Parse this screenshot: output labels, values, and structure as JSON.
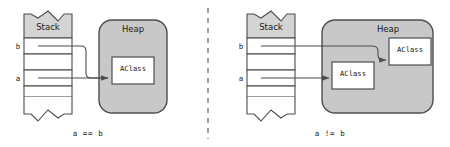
{
  "figure": {
    "type": "diagram",
    "background_color": "#ffffff",
    "stroke_color": "#4d4d4d",
    "text_color": "#1a1a1a",
    "stack_header_fill": "#d4d4d4",
    "stack_cell_fill": "#ffffff",
    "heap_fill": "#c8c8c8",
    "object_fill": "#ffffff",
    "divider": {
      "name": "panel-divider",
      "style": "dashed",
      "orientation": "vertical",
      "x": 208
    }
  },
  "panels": [
    {
      "id": "left",
      "caption": "a == b",
      "stack": {
        "title": "Stack",
        "torn_edges": true,
        "variables": [
          {
            "name": "b",
            "label": "b",
            "has_reference": true
          },
          {
            "name": "a",
            "label": "a",
            "has_reference": true
          }
        ],
        "cell_count": 5
      },
      "heap": {
        "title": "Heap",
        "objects": [
          {
            "label": "AClass",
            "id": "obj1"
          }
        ]
      },
      "references": [
        {
          "from": "b",
          "to": "obj1"
        },
        {
          "from": "a",
          "to": "obj1"
        }
      ],
      "meaning": "both variables reference the same object"
    },
    {
      "id": "right",
      "caption": "a != b",
      "stack": {
        "title": "Stack",
        "torn_edges": true,
        "variables": [
          {
            "name": "b",
            "label": "b",
            "has_reference": true
          },
          {
            "name": "a",
            "label": "a",
            "has_reference": true
          }
        ],
        "cell_count": 5
      },
      "heap": {
        "title": "Heap",
        "objects": [
          {
            "label": "AClass",
            "id": "objA"
          },
          {
            "label": "AClass",
            "id": "objB"
          }
        ]
      },
      "references": [
        {
          "from": "b",
          "to": "objB"
        },
        {
          "from": "a",
          "to": "objA"
        }
      ],
      "meaning": "each variable references a different object"
    }
  ]
}
